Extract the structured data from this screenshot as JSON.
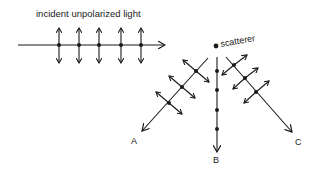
{
  "diagram": {
    "title": "incident unpolarized light",
    "scatterer_label": "scatterer",
    "directions": [
      {
        "id": "A",
        "label": "A",
        "polarization": "partially polarized"
      },
      {
        "id": "B",
        "label": "B",
        "polarization": "linearly polarized (perpendicular)"
      },
      {
        "id": "C",
        "label": "C",
        "polarization": "partially polarized"
      }
    ],
    "colors": {
      "ink": "#1a1a1a",
      "background": "#ffffff"
    }
  }
}
